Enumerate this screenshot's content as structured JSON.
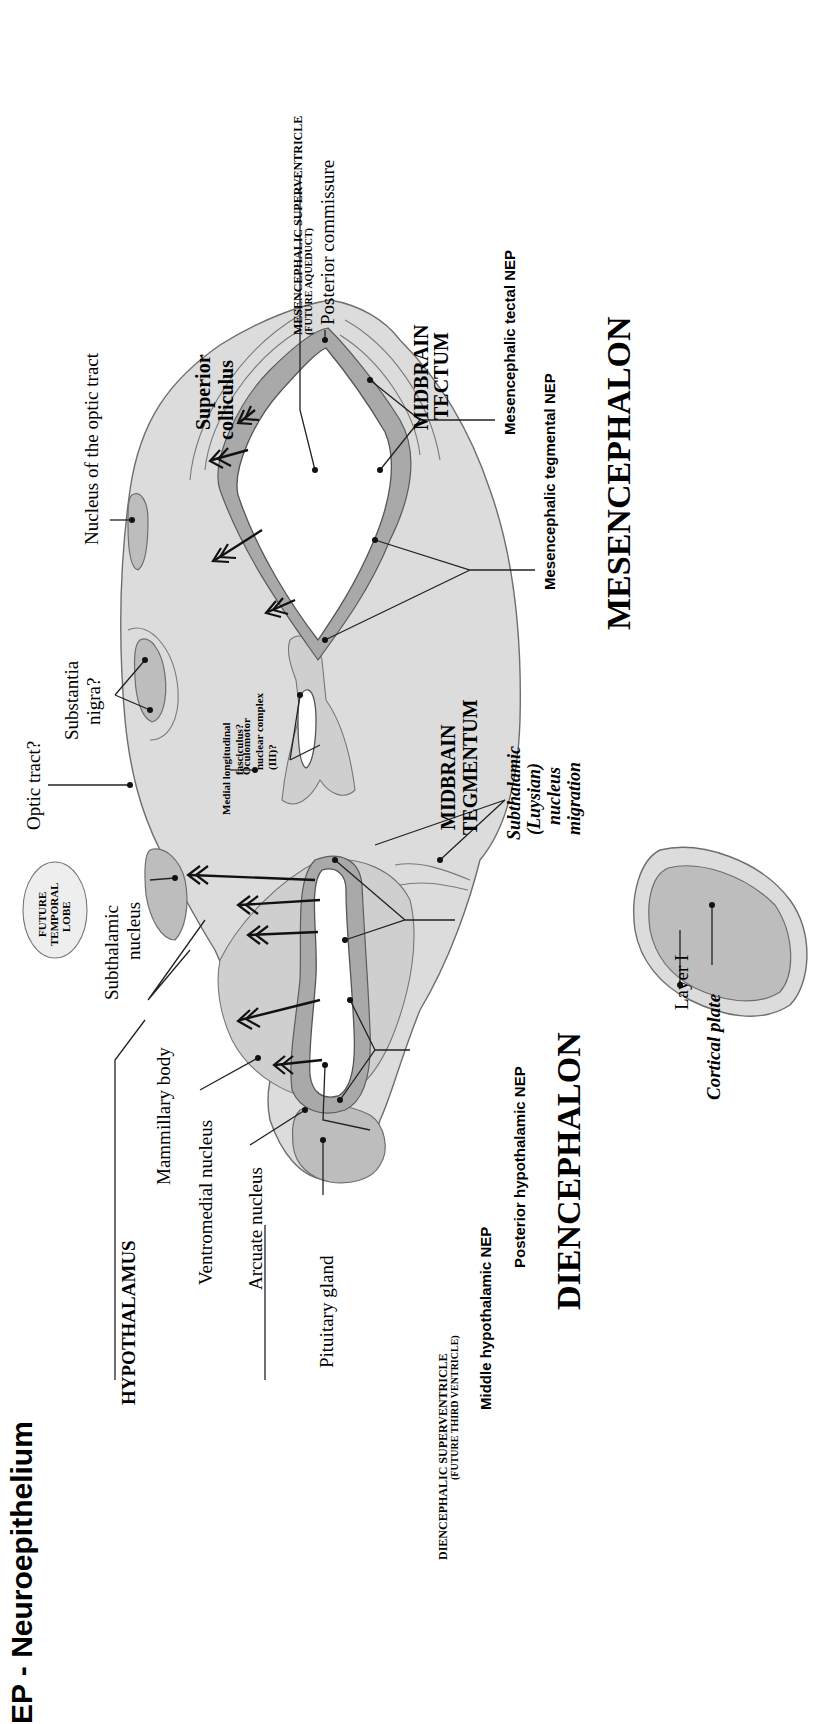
{
  "figure": {
    "title": "EP - Neuroepithelium",
    "orientation": "rotated 90deg counter-clockwise"
  },
  "regions": {
    "diencephalon": "DIENCEPHALON",
    "mesencephalon": "MESENCEPHALON",
    "hypothalamus": "HYPOTHALAMUS",
    "midbrain_tegmentum_line1": "MIDBRAIN",
    "midbrain_tegmentum_line2": "TEGMENTUM",
    "midbrain_tectum_line1": "MIDBRAIN",
    "midbrain_tectum_line2": "TECTUM",
    "future_temporal_lobe_line1": "FUTURE",
    "future_temporal_lobe_line2": "TEMPORAL",
    "future_temporal_lobe_line3": "LOBE"
  },
  "labels": {
    "mammillary_body": "Mammillary body",
    "ventromedial_nucleus": "Ventromedial nucleus",
    "arcuate_nucleus": "Arcuate nucleus",
    "pituitary_gland": "Pituitary gland",
    "diencephalic_superventricle": "DIENCEPHALIC SUPERVENTRICLE",
    "diencephalic_superventricle_sub": "(FUTURE THIRD VENTRICLE)",
    "middle_hypothalamic_nep": "Middle hypothalamic NEP",
    "posterior_hypothalamic_nep": "Posterior hypothalamic NEP",
    "subthalamic_nucleus_line1": "Subthalamic",
    "subthalamic_nucleus_line2": "nucleus",
    "optic_tract": "Optic tract?",
    "substantia_nigra_line1": "Substantia",
    "substantia_nigra_line2": "nigra?",
    "medial_longitudinal_fasciculus_line1": "Medial longitudinal",
    "medial_longitudinal_fasciculus_line2": "fasciculus?",
    "oculomotor_line1": "Oculomotor",
    "oculomotor_line2": "nuclear complex",
    "oculomotor_line3": "(III)?",
    "nucleus_optic_tract": "Nucleus of the optic tract",
    "superior_colliculus_line1": "Superior",
    "superior_colliculus_line2": "colliculus",
    "mesencephalic_superventricle": "MESENCEPHALIC SUPERVENTRICLE",
    "mesencephalic_superventricle_sub": "(FUTURE AQUEDUCT)",
    "posterior_commissure": "Posterior commissure",
    "mesencephalic_tectal_nep": "Mesencephalic tectal NEP",
    "mesencephalic_tegmental_nep": "Mesencephalic tegmental NEP",
    "subthalamic_migration_line1": "Subthalamic",
    "subthalamic_migration_line2": "(Luysian)",
    "subthalamic_migration_line3": "nucleus",
    "subthalamic_migration_line4": "migration",
    "layer_i": "Layer I",
    "cortical_plate": "Cortical plate"
  },
  "colors": {
    "tissue": "#dcdcdc",
    "tissue_dark": "#bdbdbd",
    "neuroepithelium": "#a9a9a9",
    "ink": "#111111",
    "background": "#ffffff"
  }
}
